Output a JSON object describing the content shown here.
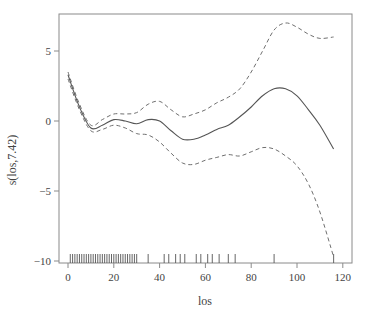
{
  "chart_data": {
    "type": "line",
    "title": "",
    "xlabel": "los",
    "ylabel": "s(los,7.42)",
    "xlim": [
      -2,
      122
    ],
    "ylim": [
      -10.8,
      7.6
    ],
    "grid": false,
    "legend": null,
    "xticks": [
      0,
      20,
      40,
      60,
      80,
      100,
      120
    ],
    "xtick_labels": [
      "0",
      "20",
      "40",
      "60",
      "80",
      "100",
      "120"
    ],
    "yticks": [
      5,
      0,
      -5,
      -10
    ],
    "ytick_labels": [
      "5",
      "0",
      "−5",
      "−10"
    ],
    "x": [
      0,
      5,
      10,
      15,
      20,
      25,
      30,
      35,
      40,
      45,
      50,
      55,
      60,
      65,
      70,
      75,
      80,
      85,
      90,
      95,
      100,
      105,
      110,
      116
    ],
    "series": [
      {
        "name": "estimate",
        "style": "solid",
        "values": [
          3.3,
          1.0,
          -0.5,
          -0.3,
          0.1,
          0.0,
          -0.2,
          0.1,
          0.0,
          -0.7,
          -1.3,
          -1.3,
          -1.0,
          -0.6,
          -0.3,
          0.3,
          1.0,
          1.8,
          2.3,
          2.3,
          1.8,
          0.8,
          -0.3,
          -2.0
        ]
      },
      {
        "name": "upper 95% band",
        "style": "dashed",
        "values": [
          3.5,
          1.2,
          -0.3,
          0.1,
          0.5,
          0.5,
          0.6,
          1.2,
          1.4,
          0.8,
          0.3,
          0.5,
          0.8,
          1.3,
          1.7,
          2.3,
          3.5,
          5.0,
          6.5,
          7.0,
          6.7,
          6.2,
          5.9,
          6.0
        ]
      },
      {
        "name": "lower 95% band",
        "style": "dashed",
        "values": [
          3.0,
          0.8,
          -0.7,
          -0.6,
          -0.3,
          -0.5,
          -0.9,
          -1.0,
          -1.5,
          -2.3,
          -3.0,
          -3.1,
          -2.8,
          -2.6,
          -2.4,
          -2.5,
          -2.2,
          -1.9,
          -2.0,
          -2.5,
          -3.2,
          -4.5,
          -6.5,
          -9.7
        ]
      }
    ],
    "rug": [
      1,
      2,
      3,
      4,
      5,
      6,
      7,
      8,
      9,
      10,
      11,
      12,
      13,
      14,
      15,
      16,
      17,
      18,
      19,
      20,
      21,
      22,
      23,
      24,
      25,
      26,
      27,
      28,
      29,
      30,
      35,
      42,
      44,
      47,
      49,
      51,
      56,
      58,
      61,
      63,
      66,
      70,
      73,
      90,
      116
    ]
  }
}
